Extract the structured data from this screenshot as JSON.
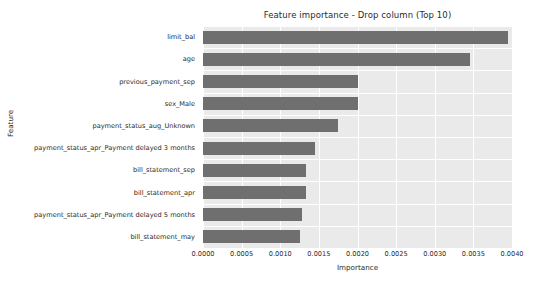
{
  "chart_data": {
    "type": "bar",
    "orientation": "horizontal",
    "title": "Feature importance - Drop column (Top 10)",
    "xlabel": "Importance",
    "ylabel": "Feature",
    "xlim": [
      0.0,
      0.004
    ],
    "grid": true,
    "legend": null,
    "bar_color": "#6f6f6f",
    "plot_background": "#eaeaea",
    "xticks": [
      "0.0000",
      "0.0005",
      "0.0010",
      "0.0015",
      "0.0020",
      "0.0025",
      "0.0030",
      "0.0035",
      "0.0040"
    ],
    "xtick_values": [
      0.0,
      0.0005,
      0.001,
      0.0015,
      0.002,
      0.0025,
      0.003,
      0.0035,
      0.004
    ],
    "categories": [
      "limit_bal",
      "age",
      "previous_payment_sep",
      "sex_Male",
      "payment_status_aug_Unknown",
      "payment_status_apr_Payment delayed 3 months",
      "bill_statement_sep",
      "bill_statement_apr",
      "payment_status_apr_Payment delayed 5 months",
      "bill_statement_may"
    ],
    "values": [
      0.00395,
      0.00345,
      0.002,
      0.002,
      0.00175,
      0.00145,
      0.00133,
      0.00133,
      0.00128,
      0.00125
    ]
  }
}
